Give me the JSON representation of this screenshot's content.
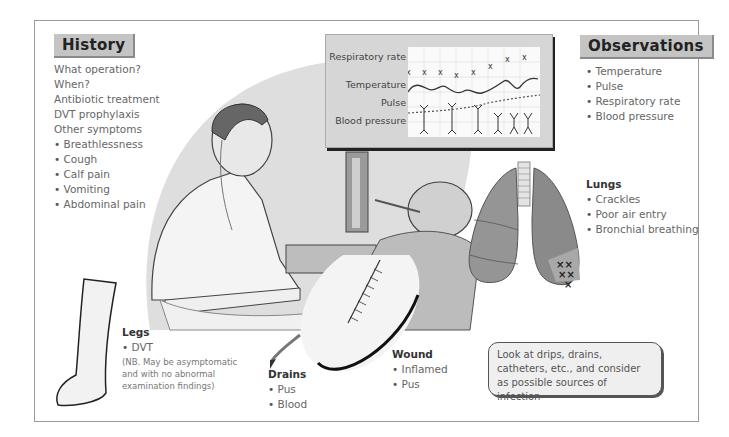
{
  "history": {
    "title": "History",
    "items": [
      "What operation?",
      "When?",
      "Antibiotic treatment",
      "DVT prophylaxis",
      "Other symptoms"
    ],
    "symptoms": [
      "Breathlessness",
      "Cough",
      "Calf pain",
      "Vomiting",
      "Abdominal pain"
    ]
  },
  "chart": {
    "labels": [
      "Respiratory rate",
      "Temperature",
      "Pulse",
      "Blood pressure"
    ]
  },
  "observations": {
    "title": "Observations",
    "items": [
      "Temperature",
      "Pulse",
      "Respiratory rate",
      "Blood pressure"
    ]
  },
  "lungs": {
    "title": "Lungs",
    "items": [
      "Crackles",
      "Poor air entry",
      "Bronchial breathing"
    ]
  },
  "legs": {
    "title": "Legs",
    "items": [
      "DVT"
    ],
    "note_lines": [
      "(NB. May be asymptomatic",
      "and with no abnormal",
      "examination findings)"
    ]
  },
  "drains": {
    "title": "Drains",
    "items": [
      "Pus",
      "Blood"
    ]
  },
  "wound": {
    "title": "Wound",
    "items": [
      "Inflamed",
      "Pus"
    ]
  },
  "note": {
    "text": "Look at drips, drains, catheters, etc., and consider as possible sources of infection"
  },
  "colors": {
    "header_bg": "#c4c4c4",
    "chart_bg": "#d6d6d6",
    "illustration_bg": "#dcdcdc",
    "lung": "#8f8f8f"
  }
}
